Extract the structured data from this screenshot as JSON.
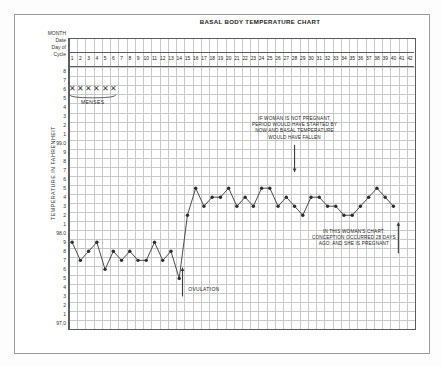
{
  "chart_title": "BASAL BODY TEMPERATURE CHART",
  "row_labels": [
    "MONTH",
    "Date",
    "Day of",
    "Cycle"
  ],
  "y_axis_caption": "TEMPERATURE IN FAHRENHEIT",
  "menses_label": "MENSES",
  "ovulation_label": "OVULATION",
  "annotation_top": "IF WOMAN IS NOT PREGNANT, PERIOD WOULD HAVE STARTED BY NOW AND BASAL TEMPERATURE WOULD HAVE FALLEN",
  "annotation_bottom": "IN THIS WOMAN'S CHART, CONCEPTION OCCURRED 28 DAYS AGO; AND SHE IS PREGNANT",
  "colors": {
    "grid": "#c9c9c9",
    "frame": "#5d5d5d",
    "line": "#3a3a3a",
    "marker": "#2e2e2e",
    "text": "#1f1f1f"
  },
  "chart_data": {
    "type": "line",
    "title": "BASAL BODY TEMPERATURE CHART",
    "xlabel": "Day of Cycle",
    "ylabel": "TEMPERATURE IN FAHRENHEIT",
    "xlim": [
      1,
      42
    ],
    "ylim": [
      97.0,
      99.8
    ],
    "grid": true,
    "legend": false,
    "x_tick_labels": [
      "1",
      "2",
      "3",
      "4",
      "5",
      "6",
      "7",
      "8",
      "9",
      "10",
      "11",
      "12",
      "13",
      "14",
      "15",
      "16",
      "17",
      "18",
      "19",
      "20",
      "21",
      "22",
      "23",
      "24",
      "25",
      "26",
      "27",
      "28",
      "29",
      "30",
      "31",
      "32",
      "33",
      "34",
      "35",
      "36",
      "37",
      "38",
      "39",
      "40",
      "41",
      "42"
    ],
    "y_tick_labels": [
      "8",
      "7",
      "6",
      "5",
      "4",
      "3",
      "2",
      "1",
      "99.0",
      "9",
      "8",
      "7",
      "6",
      "5",
      "4",
      "3",
      "2",
      "1",
      "98.0",
      "9",
      "8",
      "7",
      "6",
      "5",
      "4",
      "3",
      "2",
      "1",
      "97.0"
    ],
    "y_tick_values": [
      99.8,
      99.7,
      99.6,
      99.5,
      99.4,
      99.3,
      99.2,
      99.1,
      99.0,
      98.9,
      98.8,
      98.7,
      98.6,
      98.5,
      98.4,
      98.3,
      98.2,
      98.1,
      98.0,
      97.9,
      97.8,
      97.7,
      97.6,
      97.5,
      97.4,
      97.3,
      97.2,
      97.1,
      97.0
    ],
    "x": [
      1,
      2,
      3,
      4,
      5,
      6,
      7,
      8,
      9,
      10,
      11,
      12,
      13,
      14,
      15,
      16,
      17,
      18,
      19,
      20,
      21,
      22,
      23,
      24,
      25,
      26,
      27,
      28,
      29,
      30,
      31,
      32,
      33,
      34,
      35,
      36,
      37,
      38,
      39,
      40
    ],
    "values": [
      97.9,
      97.7,
      97.8,
      97.9,
      97.6,
      97.8,
      97.7,
      97.8,
      97.7,
      97.7,
      97.9,
      97.7,
      97.8,
      97.5,
      98.2,
      98.5,
      98.3,
      98.4,
      98.4,
      98.5,
      98.3,
      98.4,
      98.3,
      98.5,
      98.5,
      98.3,
      98.4,
      98.3,
      98.2,
      98.4,
      98.4,
      98.3,
      98.3,
      98.2,
      98.2,
      98.3,
      98.4,
      98.5,
      98.4,
      98.3
    ],
    "menses_days": [
      1,
      2,
      3,
      4,
      5,
      6
    ],
    "menses_marker_value": 99.6,
    "annotations": [
      {
        "text": "MENSES",
        "day": 3.5,
        "value": 99.35
      },
      {
        "text": "OVULATION",
        "day": 15.2,
        "value": 97.5,
        "arrow": "up",
        "arrow_day": 14.4
      },
      {
        "text": "IF WOMAN IS NOT PREGNANT, PERIOD WOULD HAVE STARTED BY NOW AND BASAL TEMPERATURE WOULD HAVE FALLEN",
        "day": 28,
        "value": 99.15,
        "arrow": "down",
        "arrow_day": 28
      },
      {
        "text": "IN THIS WOMAN'S CHART, CONCEPTION OCCURRED 28 DAYS AGO; AND SHE IS PREGNANT",
        "day": 35,
        "value": 97.9,
        "arrow": "up",
        "arrow_day": 40.5
      }
    ]
  }
}
